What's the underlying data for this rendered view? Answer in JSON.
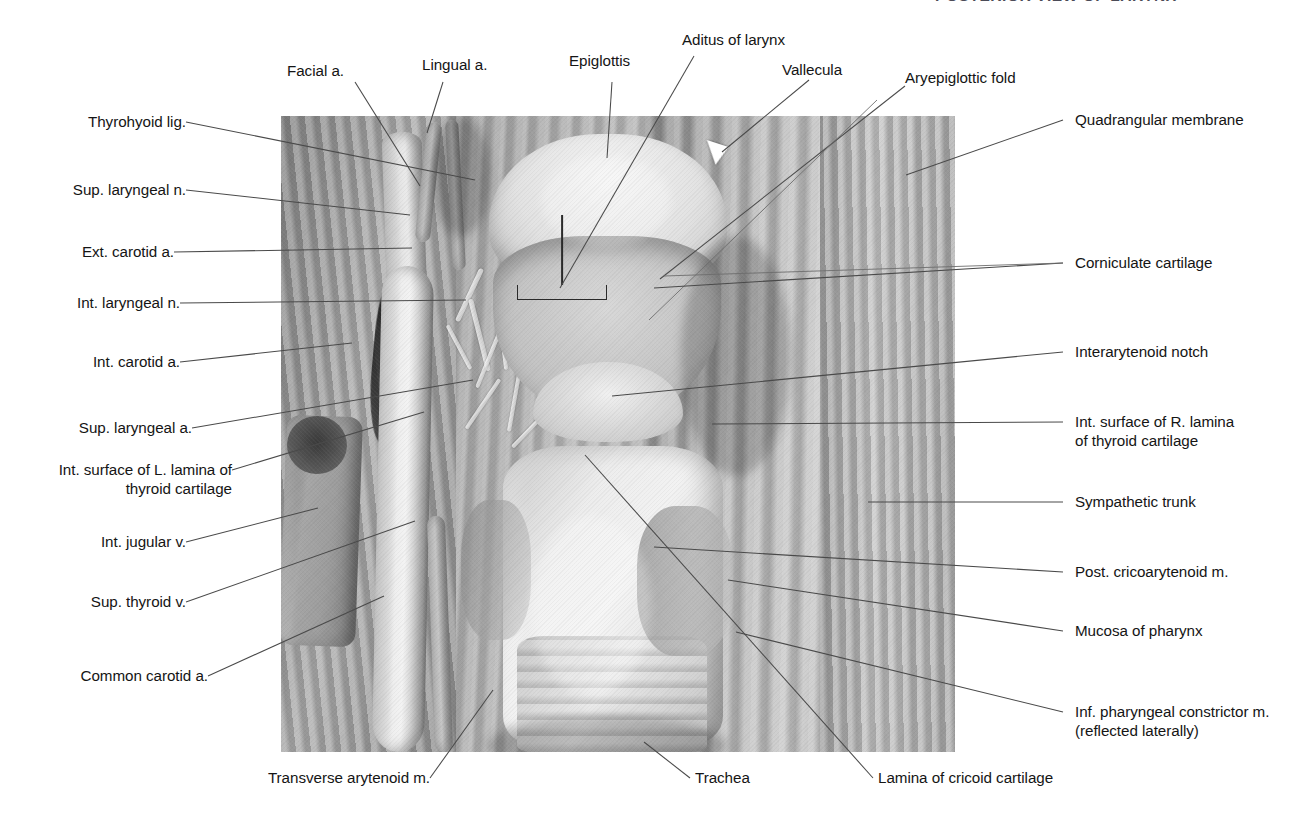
{
  "plate": {
    "title": "POSTERIOR VIEW OF LARYNX",
    "title_color": "#4b4b57"
  },
  "photo": {
    "caption": "cadaveric dissection photograph, posterior view of the larynx",
    "markers": {
      "bracket_label": "Aditus of larynx",
      "arrowhead_label": "Vallecula"
    }
  },
  "labels": {
    "top": [
      {
        "id": "facial-artery",
        "text": "Facial a."
      },
      {
        "id": "lingual-artery",
        "text": "Lingual a."
      },
      {
        "id": "epiglottis",
        "text": "Epiglottis"
      },
      {
        "id": "aditus-of-larynx",
        "text": "Aditus of larynx"
      },
      {
        "id": "vallecula",
        "text": "Vallecula"
      },
      {
        "id": "aryepiglottic-fold",
        "text": "Aryepiglottic fold"
      }
    ],
    "left": [
      {
        "id": "thyrohyoid-ligament",
        "text": "Thyrohyoid lig."
      },
      {
        "id": "superior-laryngeal-nerve",
        "text": "Sup. laryngeal n."
      },
      {
        "id": "external-carotid-artery",
        "text": "Ext. carotid a."
      },
      {
        "id": "internal-laryngeal-nerve",
        "text": "Int. laryngeal n."
      },
      {
        "id": "internal-carotid-artery",
        "text": "Int. carotid a."
      },
      {
        "id": "superior-laryngeal-artery",
        "text": "Sup. laryngeal a."
      },
      {
        "id": "internal-surface-left-lamina",
        "text": "Int. surface of L. lamina of\nthyroid cartilage"
      },
      {
        "id": "internal-jugular-vein",
        "text": "Int. jugular v."
      },
      {
        "id": "superior-thyroid-vein",
        "text": "Sup. thyroid v."
      },
      {
        "id": "common-carotid-artery",
        "text": "Common carotid a."
      }
    ],
    "right": [
      {
        "id": "quadrangular-membrane",
        "text": "Quadrangular membrane"
      },
      {
        "id": "corniculate-cartilage",
        "text": "Corniculate cartilage"
      },
      {
        "id": "interarytenoid-notch",
        "text": "Interarytenoid notch"
      },
      {
        "id": "internal-surface-right-lamina",
        "text": "Int. surface of R. lamina\nof thyroid cartilage"
      },
      {
        "id": "sympathetic-trunk",
        "text": "Sympathetic trunk"
      },
      {
        "id": "posterior-cricoarytenoid-muscle",
        "text": "Post. cricoarytenoid m."
      },
      {
        "id": "mucosa-of-pharynx",
        "text": "Mucosa of pharynx"
      },
      {
        "id": "inferior-pharyngeal-constrictor",
        "text": "Inf. pharyngeal constrictor m.\n(reflected laterally)"
      }
    ],
    "bottom": [
      {
        "id": "transverse-arytenoid-muscle",
        "text": "Transverse arytenoid m."
      },
      {
        "id": "trachea",
        "text": "Trachea"
      },
      {
        "id": "lamina-of-cricoid-cartilage",
        "text": "Lamina of cricoid cartilage"
      }
    ]
  }
}
